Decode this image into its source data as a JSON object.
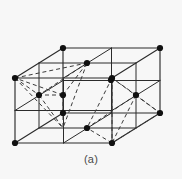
{
  "figure": {
    "caption": "(a)",
    "background_color": "#f7f7f7",
    "line_color": "#2b2b2b",
    "dash_color": "#3a3a3a",
    "atom_color": "#111111",
    "atom_radius": 3.1,
    "solid_stroke_width": 1.15,
    "dashed_stroke_width": 1.0,
    "dash_pattern": "4,3"
  },
  "geometry": {
    "projection": "oblique",
    "depth_offset": {
      "dx": 48,
      "dy": -30
    },
    "cube_size": {
      "width": 97,
      "height": 64
    },
    "front_face": {
      "top_left": {
        "x": 15,
        "y": 78
      },
      "top_right": {
        "x": 112,
        "y": 78
      },
      "bottom_right": {
        "x": 112,
        "y": 143
      },
      "bottom_left": {
        "x": 15,
        "y": 143
      }
    },
    "back_face": {
      "top_left": {
        "x": 63,
        "y": 48
      },
      "top_right": {
        "x": 160,
        "y": 48
      },
      "bottom_right": {
        "x": 160,
        "y": 113
      },
      "bottom_left": {
        "x": 63,
        "y": 113
      }
    }
  },
  "atoms": {
    "corner_label": "corner atom",
    "face_center_label": "face-center atom",
    "corners": [
      {
        "id": "front-top-left",
        "x": 15,
        "y": 78
      },
      {
        "id": "front-top-right",
        "x": 112,
        "y": 78
      },
      {
        "id": "front-bottom-right",
        "x": 112,
        "y": 143
      },
      {
        "id": "front-bottom-left",
        "x": 15,
        "y": 143
      },
      {
        "id": "back-top-left",
        "x": 63,
        "y": 48
      },
      {
        "id": "back-top-right",
        "x": 160,
        "y": 48
      },
      {
        "id": "back-bottom-right",
        "x": 160,
        "y": 113
      },
      {
        "id": "back-bottom-left",
        "x": 63,
        "y": 113
      }
    ],
    "face_centers": [
      {
        "id": "face-top",
        "x": 87,
        "y": 63
      },
      {
        "id": "face-bottom",
        "x": 87,
        "y": 128
      },
      {
        "id": "face-left",
        "x": 39,
        "y": 95
      },
      {
        "id": "face-right",
        "x": 136,
        "y": 95
      },
      {
        "id": "face-front",
        "x": 63,
        "y": 110
      },
      {
        "id": "face-back",
        "x": 111,
        "y": 80
      }
    ],
    "extra_nodes": [
      {
        "id": "mid-edge-left-vertical",
        "x": 15,
        "y": 110
      },
      {
        "id": "mid-edge-right-vertical",
        "x": 112,
        "y": 110
      }
    ]
  },
  "grid_lines": {
    "description": "internal quartering lines of each visible face",
    "count": 12
  },
  "tetrahedra": [
    {
      "id": "tetrahedron-left",
      "center": {
        "x": 63,
        "y": 95
      },
      "vertices": [
        {
          "x": 15,
          "y": 78
        },
        {
          "x": 87,
          "y": 63
        },
        {
          "x": 39,
          "y": 95
        },
        {
          "x": 63,
          "y": 128
        }
      ]
    },
    {
      "id": "tetrahedron-right",
      "center": {
        "x": 136,
        "y": 95
      },
      "vertices": [
        {
          "x": 112,
          "y": 78
        },
        {
          "x": 160,
          "y": 113
        },
        {
          "x": 112,
          "y": 143
        },
        {
          "x": 87,
          "y": 128
        }
      ]
    }
  ]
}
